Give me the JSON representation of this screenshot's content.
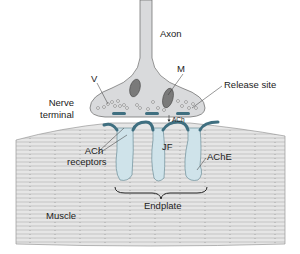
{
  "diagram": {
    "labels": {
      "axon": "Axon",
      "vesicle": "V",
      "mitochondrion": "M",
      "release_site": "Release site",
      "nerve_terminal_line1": "Nerve",
      "nerve_terminal_line2": "terminal",
      "ach": "ACh",
      "junctional_fold": "JF",
      "ach_receptors_line1": "ACh",
      "ach_receptors_line2": "receptors",
      "ache": "AChE",
      "endplate": "Endplate",
      "muscle": "Muscle"
    },
    "colors": {
      "nerve_fill": "#d9dadc",
      "muscle_fill": "#e4e4e4",
      "muscle_stripe": "#9a9a9a",
      "receptor": "#3f6f80",
      "fold_fill": "#cfe3ea",
      "outline": "#555555"
    }
  }
}
